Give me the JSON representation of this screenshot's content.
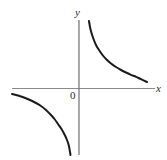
{
  "figure": {
    "name": "hyperbola-graph",
    "background_color": "#ffffff",
    "width": 167,
    "height": 160
  },
  "labels": {
    "y_axis_label": "y",
    "x_axis_label": "x",
    "origin_label": "0"
  },
  "colors": {
    "curve": "#1a1a1a",
    "x_axis": "#8a8a8a",
    "y_axis": "#6f6f6f",
    "text": "#2b2b2b",
    "background": "#ffffff"
  },
  "chart_data": {
    "type": "line",
    "title": "",
    "xlabel": "x",
    "ylabel": "y",
    "grid": false,
    "legend": "none",
    "origin_label": "0",
    "function": "y = k / x, k > 0",
    "axes": {
      "x_axis_pixel_y": 88,
      "y_axis_pixel_x": 79,
      "x_axis_pixel_range": [
        12,
        155
      ],
      "y_axis_pixel_range": [
        20,
        155
      ],
      "x_arrow": false,
      "y_arrow": false,
      "ticks": []
    },
    "xlim": [
      -3.35,
      4.4
    ],
    "ylim": [
      -4.2,
      2.1
    ],
    "series": [
      {
        "name": "upper-right-branch",
        "quadrant": 1,
        "points_pixel": [
          [
            89,
            21
          ],
          [
            90,
            27
          ],
          [
            91.5,
            33
          ],
          [
            93.5,
            39
          ],
          [
            96,
            45
          ],
          [
            99,
            50
          ],
          [
            102.5,
            55
          ],
          [
            106.5,
            59.5
          ],
          [
            111,
            63.5
          ],
          [
            116,
            67
          ],
          [
            121,
            70
          ],
          [
            126,
            72.5
          ],
          [
            131,
            74.8
          ],
          [
            136,
            76.8
          ],
          [
            141,
            79.2
          ],
          [
            147,
            82
          ]
        ],
        "points_data": [
          [
            0.5,
            2.04
          ],
          [
            0.55,
            1.86
          ],
          [
            0.62,
            1.69
          ],
          [
            0.73,
            1.4
          ],
          [
            0.85,
            1.2
          ],
          [
            1.0,
            1.0
          ],
          [
            1.2,
            0.83
          ],
          [
            1.45,
            0.69
          ],
          [
            1.75,
            0.57
          ],
          [
            2.1,
            0.48
          ],
          [
            2.5,
            0.4
          ],
          [
            3.0,
            0.33
          ],
          [
            3.5,
            0.29
          ],
          [
            4.0,
            0.25
          ],
          [
            4.4,
            0.19
          ]
        ]
      },
      {
        "name": "lower-left-branch",
        "quadrant": 3,
        "points_pixel": [
          [
            12,
            94
          ],
          [
            18,
            95.5
          ],
          [
            24,
            97.5
          ],
          [
            30,
            100
          ],
          [
            36,
            103
          ],
          [
            41,
            106
          ],
          [
            46,
            110
          ],
          [
            50.5,
            114.5
          ],
          [
            54.5,
            119
          ],
          [
            58,
            124
          ],
          [
            61.5,
            129
          ],
          [
            64.5,
            134.5
          ],
          [
            67,
            140
          ],
          [
            68.8,
            145.5
          ],
          [
            70,
            152
          ],
          [
            70.5,
            155
          ]
        ],
        "points_data": [
          [
            -3.35,
            -0.19
          ],
          [
            -3.0,
            -0.25
          ],
          [
            -2.6,
            -0.33
          ],
          [
            -2.3,
            -0.4
          ],
          [
            -2.0,
            -0.48
          ],
          [
            -1.75,
            -0.57
          ],
          [
            -1.5,
            -0.69
          ],
          [
            -1.3,
            -0.83
          ],
          [
            -1.1,
            -1.0
          ],
          [
            -0.95,
            -1.2
          ],
          [
            -0.82,
            -1.4
          ],
          [
            -0.72,
            -1.69
          ],
          [
            -0.63,
            -2.0
          ],
          [
            -0.57,
            -2.4
          ],
          [
            -0.52,
            -3.1
          ],
          [
            -0.5,
            -3.9
          ]
        ]
      }
    ]
  }
}
